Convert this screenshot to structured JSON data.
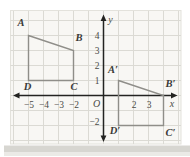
{
  "page": {
    "background": "#ffffff",
    "bottom_band_color": "#d7d6d1",
    "bottom_band_light_color": "#ebeae6"
  },
  "figure": {
    "plot": {
      "background": "#f8f7f4",
      "border_color": "#e3e2dc",
      "grid_color": "#dbdad4",
      "axis_color": "#232321",
      "shape_color": "#8f8e89",
      "vertex_label_color": "#3a3a38",
      "tick_label_color": "#4b4b47"
    },
    "view": {
      "origin_px": {
        "x": 103.5,
        "y": 95.5
      },
      "unit_px": 15,
      "grid_x_range": [
        -6,
        5
      ],
      "grid_y_range": [
        -3,
        5
      ]
    },
    "axes": {
      "x_label": "x",
      "y_label": "y",
      "origin_label": "O",
      "x_ticks": [
        {
          "v": -5,
          "label": "−5"
        },
        {
          "v": -4,
          "label": "−4"
        },
        {
          "v": -3,
          "label": "−3"
        },
        {
          "v": -2,
          "label": "−2"
        },
        {
          "v": 2,
          "label": "2"
        },
        {
          "v": 3,
          "label": "3"
        }
      ],
      "y_ticks": [
        {
          "v": 4,
          "label": "4",
          "dy": 0
        },
        {
          "v": 3,
          "label": "3",
          "dy": 0
        },
        {
          "v": 2,
          "label": "2",
          "dy": 0
        },
        {
          "v": 1,
          "label": "1",
          "dy": 0
        },
        {
          "v": -2,
          "label": "−2",
          "dy": -3.5
        }
      ]
    },
    "shapes": [
      {
        "id": "quad-ABCD",
        "vertices": [
          {
            "label": "A",
            "x": -5,
            "y": 4,
            "label_dx": -7.5,
            "label_dy": -9.5
          },
          {
            "label": "B",
            "x": -2,
            "y": 3,
            "label_dx": 5.5,
            "label_dy": -10
          },
          {
            "label": "C",
            "x": -2,
            "y": 1,
            "label_dx": 0.5,
            "label_dy": 9
          },
          {
            "label": "D",
            "x": -5,
            "y": 1,
            "label_dx": -1,
            "label_dy": 9
          }
        ]
      },
      {
        "id": "quad-A1B1C1D1",
        "vertices": [
          {
            "label": "A′",
            "x": 1,
            "y": 1,
            "label_dx": -5.5,
            "label_dy": -7.5
          },
          {
            "label": "B′",
            "x": 4,
            "y": 0,
            "label_dx": 7,
            "label_dy": -8.5
          },
          {
            "label": "C′",
            "x": 4,
            "y": -2,
            "label_dx": 7,
            "label_dy": 10.5
          },
          {
            "label": "D′",
            "x": 1,
            "y": -2,
            "label_dx": -3.5,
            "label_dy": 8.5
          }
        ]
      }
    ]
  }
}
